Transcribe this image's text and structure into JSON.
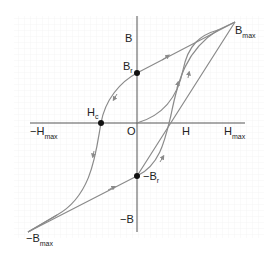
{
  "diagram": {
    "colors": {
      "background": "#ffffff",
      "grid": "#f0f0f0",
      "axis": "#555555",
      "curve": "#8a8a8a",
      "point": "#111111",
      "text": "#222222"
    },
    "axes": {
      "y_top": {
        "main": "B",
        "sub": ""
      },
      "y_bottom": {
        "main": "−B",
        "sub": ""
      },
      "x_right": {
        "main": "H",
        "sub": "max"
      },
      "x_left": {
        "main": "−H",
        "sub": "max"
      },
      "origin": "O",
      "h_tick": "H"
    },
    "points": {
      "br": {
        "main": "B",
        "sub": "r"
      },
      "neg_br": {
        "main": "−B",
        "sub": "r"
      },
      "hc": {
        "main": "H",
        "sub": "c"
      },
      "bmax": {
        "main": "B",
        "sub": "max"
      },
      "neg_bmax": {
        "main": "−B",
        "sub": "max"
      }
    }
  }
}
